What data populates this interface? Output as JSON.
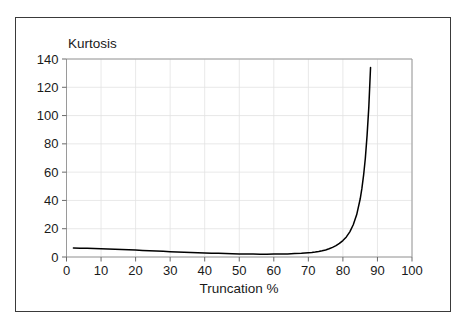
{
  "chart_data": {
    "type": "line",
    "title": "",
    "xlabel": "Truncation %",
    "ylabel": "Kurtosis",
    "xlim": [
      0,
      100
    ],
    "ylim": [
      0,
      140
    ],
    "grid": true,
    "legend": "none",
    "xticks": [
      "0",
      "10",
      "20",
      "30",
      "40",
      "50",
      "60",
      "70",
      "80",
      "90",
      "100"
    ],
    "yticks": [
      "0",
      "20",
      "40",
      "60",
      "80",
      "100",
      "120",
      "140"
    ],
    "series": [
      {
        "name": "Kurtosis vs Truncation",
        "color": "#000000",
        "x": [
          2,
          4,
          6,
          8,
          10,
          12,
          14,
          16,
          18,
          20,
          22,
          24,
          26,
          28,
          30,
          32,
          34,
          36,
          38,
          40,
          42,
          44,
          46,
          48,
          50,
          52,
          54,
          56,
          58,
          60,
          62,
          64,
          66,
          68,
          70,
          71,
          72,
          73,
          74,
          75,
          76,
          77,
          78,
          79,
          80,
          81,
          82,
          83,
          84,
          85,
          85.5,
          86,
          86.5,
          87,
          87.5,
          88
        ],
        "values": [
          6.3,
          6.2,
          6.1,
          6.0,
          5.9,
          5.7,
          5.5,
          5.3,
          5.1,
          4.9,
          4.6,
          4.4,
          4.2,
          4.0,
          3.8,
          3.6,
          3.4,
          3.2,
          3.0,
          2.9,
          2.7,
          2.6,
          2.4,
          2.3,
          2.2,
          2.1,
          2.05,
          2.0,
          2.0,
          2.05,
          2.1,
          2.2,
          2.4,
          2.6,
          3.0,
          3.2,
          3.5,
          3.9,
          4.4,
          5.0,
          5.8,
          6.8,
          8.0,
          9.6,
          11.6,
          14.2,
          17.8,
          22.8,
          30.0,
          41.0,
          48.5,
          58.0,
          70.0,
          86.0,
          106.0,
          134.0
        ]
      }
    ]
  },
  "labels": {
    "y_axis_title": "Kurtosis",
    "x_axis_title": "Truncation %"
  }
}
